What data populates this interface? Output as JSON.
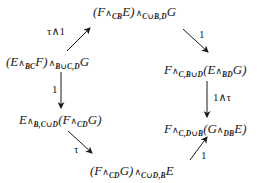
{
  "diagram": {
    "type": "commutative-diagram",
    "nodes": [
      {
        "id": "top",
        "parts": [
          "(F",
          "∧",
          "CB",
          "E)",
          "∧",
          "C∪B,D",
          "G"
        ],
        "text": "(F ∧_CB E) ∧_{C∪B,D} G"
      },
      {
        "id": "left-upper",
        "parts": [
          "(E",
          "∧",
          "BC",
          "F)",
          "∧",
          "B∪C,D",
          "G"
        ],
        "text": "(E ∧_BC F) ∧_{B∪C,D} G"
      },
      {
        "id": "right-upper",
        "parts": [
          "F",
          "∧",
          "C,B∪D",
          "(E",
          "∧",
          "BD",
          "G)"
        ],
        "text": "F ∧_{C,B∪D} (E ∧_BD G)"
      },
      {
        "id": "left-lower",
        "parts": [
          "E",
          "∧",
          "B,C∪D",
          "(F",
          "∧",
          "CD",
          "G)"
        ],
        "text": "E ∧_{B,C∪D} (F ∧_CD G)"
      },
      {
        "id": "right-lower",
        "parts": [
          "F",
          "∧",
          "C,D∪B",
          "(G",
          "∧",
          "DB",
          "E)"
        ],
        "text": "F ∧_{C,D∪B} (G ∧_DB E)"
      },
      {
        "id": "bottom",
        "parts": [
          "(F",
          "∧",
          "CD",
          "G)",
          "∧",
          "C∪D,B",
          "E"
        ],
        "text": "(F ∧_CD G) ∧_{C∪D,B} E"
      }
    ],
    "arrows": [
      {
        "from": "left-upper",
        "to": "top",
        "label": "τ∧1"
      },
      {
        "from": "top",
        "to": "right-upper",
        "label": "1"
      },
      {
        "from": "left-upper",
        "to": "left-lower",
        "label": "1"
      },
      {
        "from": "right-upper",
        "to": "right-lower",
        "label": "1∧τ"
      },
      {
        "from": "left-lower",
        "to": "bottom",
        "label": "τ"
      },
      {
        "from": "bottom",
        "to": "right-lower",
        "label": "1"
      }
    ]
  }
}
